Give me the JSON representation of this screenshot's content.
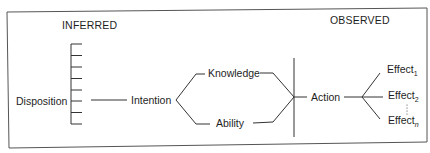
{
  "diagram": {
    "headers": {
      "inferred": "INFERRED",
      "observed": "OBSERVED"
    },
    "nodes": {
      "disposition": "Disposition",
      "intention": "Intention",
      "knowledge": "Knowledge",
      "ability": "Ability",
      "action": "Action",
      "effects": [
        {
          "label": "Effect",
          "sub": "1"
        },
        {
          "label": "Effect",
          "sub": "2"
        },
        {
          "label": "Effect",
          "sub": "n"
        }
      ]
    },
    "edges": [
      [
        "Disposition",
        "Intention"
      ],
      [
        "Intention",
        "Knowledge"
      ],
      [
        "Intention",
        "Ability"
      ],
      [
        "Knowledge",
        "Action"
      ],
      [
        "Ability",
        "Action"
      ],
      [
        "Action",
        "Effect1"
      ],
      [
        "Action",
        "Effect2"
      ],
      [
        "Action",
        "Effectn"
      ]
    ],
    "disposition_scale_ticks": 8,
    "colors": {
      "line": "#333333",
      "text": "#1e1e1e",
      "background": "#ffffff"
    }
  }
}
